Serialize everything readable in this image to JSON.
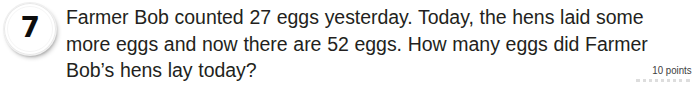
{
  "item": {
    "number": "7",
    "points_label": "10 points",
    "question_lines": [
      "Farmer Bob counted 27 eggs yesterday. Today, the hens laid some",
      "more eggs and now there are 52 eggs. How many eggs did Farmer",
      "Bob’s hens lay today?"
    ],
    "question_full": "Farmer Bob counted 27 eggs yesterday. Today, the hens laid some more eggs and now there are 52 eggs. How many eggs did Farmer Bob’s hens lay today?",
    "values_mentioned": {
      "eggs_yesterday": 27,
      "eggs_now": 52,
      "points": 10
    },
    "colors": {
      "background": "#ffffff",
      "text": "#231f20",
      "badge_number": "#0d0d0d",
      "badge_ring": "#e9e9e9",
      "points_text": "#3d3d3d",
      "dotted_rule": "#d8d8d8"
    }
  }
}
